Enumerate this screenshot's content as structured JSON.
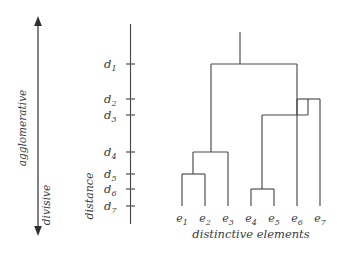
{
  "figure": {
    "caption": "distinctive  elements",
    "axis_title": "distance",
    "direction_top": "agglomerative",
    "direction_bottom": "divisive",
    "stroke_color": "#4a4a4a",
    "text_color": "#3a3a3a",
    "background": "#ffffff"
  },
  "distance_axis": {
    "ticks": [
      {
        "label": "d",
        "sub": "1",
        "y": 64
      },
      {
        "label": "d",
        "sub": "2",
        "y": 99
      },
      {
        "label": "d",
        "sub": "3",
        "y": 115
      },
      {
        "label": "d",
        "sub": "4",
        "y": 152
      },
      {
        "label": "d",
        "sub": "5",
        "y": 174
      },
      {
        "label": "d",
        "sub": "6",
        "y": 189
      },
      {
        "label": "d",
        "sub": "7",
        "y": 206
      }
    ]
  },
  "leaves": [
    {
      "label": "e",
      "sub": "1",
      "x": 182
    },
    {
      "label": "e",
      "sub": "2",
      "x": 205
    },
    {
      "label": "e",
      "sub": "3",
      "x": 228
    },
    {
      "label": "e",
      "sub": "4",
      "x": 251
    },
    {
      "label": "e",
      "sub": "5",
      "x": 274
    },
    {
      "label": "e",
      "sub": "6",
      "x": 297
    },
    {
      "label": "e",
      "sub": "7",
      "x": 320
    }
  ],
  "chart_data": {
    "type": "dendrogram",
    "title": "",
    "xlabel": "distinctive elements",
    "ylabel": "distance",
    "orientation": "top-root",
    "leaf_labels": [
      "e1",
      "e2",
      "e3",
      "e4",
      "e5",
      "e6",
      "e7"
    ],
    "distance_levels": [
      "d1",
      "d2",
      "d3",
      "d4",
      "d5",
      "d6",
      "d7"
    ],
    "baseline_level": "d7",
    "merges": [
      {
        "id": "m1",
        "level": "d5",
        "children": [
          "e1",
          "e2"
        ],
        "center_x": 193
      },
      {
        "id": "m2",
        "level": "d6",
        "children": [
          "e4",
          "e5"
        ],
        "center_x": 262
      },
      {
        "id": "m3",
        "level": "d4",
        "children": [
          "m1",
          "e3"
        ],
        "center_x": 211
      },
      {
        "id": "m4",
        "level": "d2",
        "children": [
          "e6",
          "e7"
        ],
        "center_x": 308
      },
      {
        "id": "m5",
        "level": "d3",
        "children": [
          "m2",
          "m4"
        ],
        "center_x": 297
      },
      {
        "id": "m6",
        "level": "d1",
        "children": [
          "m3",
          "m5"
        ],
        "center_x": 240
      }
    ]
  }
}
